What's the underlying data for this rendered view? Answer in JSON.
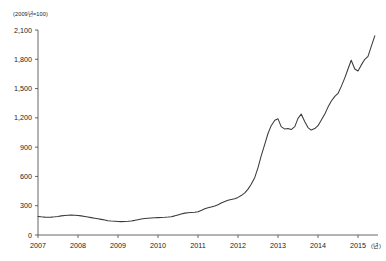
{
  "unit_note": "(2009년=100)",
  "x_unit_note": "(년)",
  "colors": {
    "line": "#3a3a3a",
    "axis": "#555555",
    "text": "#222222",
    "background": "#ffffff"
  },
  "chart_data": {
    "type": "line",
    "title": "",
    "subtitle": "",
    "xlabel": "(년)",
    "ylabel": "(2009년=100)",
    "xlim": [
      2007.0,
      2015.5
    ],
    "ylim": [
      0,
      2100
    ],
    "grid": false,
    "legend": "none",
    "y_ticks": [
      0,
      300,
      600,
      900,
      1200,
      1500,
      1800,
      2100
    ],
    "y_tick_labels": [
      "0",
      "300",
      "600",
      "900",
      "1,200",
      "1,500",
      "1,800",
      "2,100"
    ],
    "x_ticks": [
      2007,
      2008,
      2009,
      2010,
      2011,
      2012,
      2013,
      2014,
      2015
    ],
    "x_tick_labels": [
      "2007",
      "2008",
      "2009",
      "2010",
      "2011",
      "2012",
      "2013",
      "2014",
      "2015"
    ],
    "series": [
      {
        "name": "index",
        "x": [
          2007.0,
          2007.08,
          2007.17,
          2007.25,
          2007.33,
          2007.42,
          2007.5,
          2007.58,
          2007.67,
          2007.75,
          2007.83,
          2007.92,
          2008.0,
          2008.08,
          2008.17,
          2008.25,
          2008.33,
          2008.42,
          2008.5,
          2008.58,
          2008.67,
          2008.75,
          2008.83,
          2008.92,
          2009.0,
          2009.08,
          2009.17,
          2009.25,
          2009.33,
          2009.42,
          2009.5,
          2009.58,
          2009.67,
          2009.75,
          2009.83,
          2009.92,
          2010.0,
          2010.08,
          2010.17,
          2010.25,
          2010.33,
          2010.42,
          2010.5,
          2010.58,
          2010.67,
          2010.75,
          2010.83,
          2010.92,
          2011.0,
          2011.08,
          2011.17,
          2011.25,
          2011.33,
          2011.42,
          2011.5,
          2011.58,
          2011.67,
          2011.75,
          2011.83,
          2011.92,
          2012.0,
          2012.08,
          2012.17,
          2012.25,
          2012.33,
          2012.42,
          2012.5,
          2012.58,
          2012.67,
          2012.75,
          2012.83,
          2012.92,
          2013.0,
          2013.08,
          2013.17,
          2013.25,
          2013.33,
          2013.42,
          2013.5,
          2013.58,
          2013.67,
          2013.75,
          2013.83,
          2013.92,
          2014.0,
          2014.08,
          2014.17,
          2014.25,
          2014.33,
          2014.42,
          2014.5,
          2014.58,
          2014.67,
          2014.75,
          2014.83,
          2014.92,
          2015.0,
          2015.08,
          2015.17,
          2015.25,
          2015.33,
          2015.42
        ],
        "values": [
          190,
          186,
          183,
          182,
          183,
          186,
          190,
          196,
          200,
          203,
          204,
          203,
          200,
          196,
          190,
          184,
          178,
          172,
          166,
          160,
          153,
          147,
          143,
          140,
          138,
          137,
          138,
          140,
          144,
          150,
          157,
          163,
          168,
          172,
          175,
          177,
          178,
          179,
          181,
          184,
          188,
          196,
          206,
          216,
          224,
          228,
          230,
          232,
          238,
          252,
          268,
          280,
          288,
          296,
          310,
          328,
          344,
          356,
          364,
          372,
          385,
          404,
          432,
          470,
          520,
          590,
          690,
          810,
          930,
          1040,
          1120,
          1175,
          1190,
          1110,
          1085,
          1090,
          1080,
          1110,
          1195,
          1240,
          1160,
          1100,
          1075,
          1090,
          1120,
          1175,
          1240,
          1310,
          1370,
          1420,
          1450,
          1520,
          1610,
          1700,
          1790,
          1700,
          1680,
          1740,
          1800,
          1830,
          1930,
          2040
        ]
      }
    ]
  }
}
